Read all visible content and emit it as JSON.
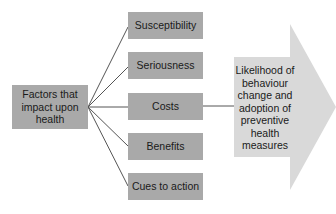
{
  "diagram": {
    "source": "Factors that impact upon health",
    "factors": [
      {
        "label": "Susceptibility",
        "top": 12
      },
      {
        "label": "Seriousness",
        "top": 52
      },
      {
        "label": "Costs",
        "top": 93
      },
      {
        "label": "Benefits",
        "top": 133
      },
      {
        "label": "Cues to action",
        "top": 173
      }
    ],
    "outcome": "Likelihood of behaviour change and adoption of preventive health measures",
    "colors": {
      "box": "#a9a9a9",
      "arrow": "#d9d9d9",
      "line": "#555555"
    }
  }
}
